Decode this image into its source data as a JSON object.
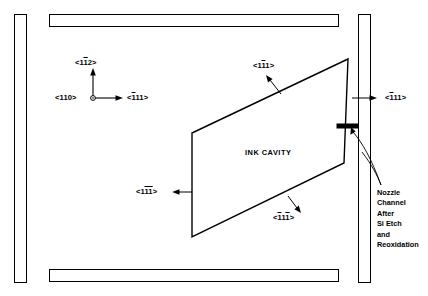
{
  "figure": {
    "background_color": "#ffffff",
    "line_color": "#000000"
  },
  "cavity": {
    "label": "INK CAVITY"
  },
  "axis_triad": {
    "name": "crystal-direction-triad",
    "origin_marker": "circle",
    "vertical_label": {
      "prefix": "<1",
      "barred": "1",
      "suffix": "2>",
      "full": "<1̒1̒2>",
      "plain": "<112>"
    },
    "left_label": {
      "prefix": "<110>",
      "barred": "",
      "suffix": "",
      "full": "<110>",
      "plain": "<110>"
    },
    "right_label": {
      "prefix": "<",
      "barred": "1",
      "suffix": "11>",
      "full": "<111>",
      "plain": "<111>"
    }
  },
  "direction_labels": {
    "upper_right": {
      "prefix": "<1",
      "barred": "1",
      "suffix": "1>",
      "plain": "<111>"
    },
    "far_right": {
      "prefix": "<",
      "barred": "1",
      "suffix": "11>",
      "plain": "<111>"
    },
    "lower_left": {
      "prefix": "<1",
      "barred": "11",
      "suffix": ">",
      "plain": "<111>"
    },
    "lower_middle": {
      "prefix": "<",
      "barred": "1",
      "middle": "1",
      "barred2": "1",
      "suffix": ">",
      "plain": "<111>"
    }
  },
  "callout": {
    "name": "nozzle-channel-callout",
    "lines": [
      "Nozzle",
      "Channel",
      "After",
      "Si Etch",
      "and",
      "Reoxidation"
    ]
  },
  "frame_bars": [
    {
      "name": "left-frame-bar"
    },
    {
      "name": "top-frame-bar"
    },
    {
      "name": "right-frame-bar"
    },
    {
      "name": "bottom-frame-bar"
    }
  ],
  "nozzle_marker": {
    "name": "nozzle-channel-marker"
  }
}
